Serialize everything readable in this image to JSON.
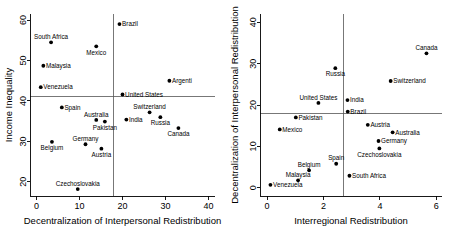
{
  "figure": {
    "panel_count": 2,
    "background": "#ffffff",
    "point_color": "#000000",
    "refline_color": "#555555"
  },
  "chart_data": [
    {
      "type": "scatter",
      "panel": "left",
      "title": "",
      "xlabel": "Decentralization of Interpersonal Redistribution",
      "ylabel": "Income Inequality",
      "xlim": [
        -1.5,
        41.5
      ],
      "ylim": [
        16.5,
        61.5
      ],
      "xticks": [
        0,
        10,
        20,
        30,
        40
      ],
      "yticks": [
        20,
        30,
        40,
        50,
        60
      ],
      "xtick_labels": [
        "0",
        "10",
        "20",
        "30",
        "40"
      ],
      "ytick_labels": [
        "20",
        "30",
        "40",
        "50",
        "60"
      ],
      "grid": false,
      "legend": "none",
      "reference_lines": {
        "horizontal_y": 41.0,
        "vertical_x": 18.0
      },
      "points": [
        {
          "label": "Brazil",
          "x": 19.3,
          "y": 59.0,
          "label_pos": "right"
        },
        {
          "label": "South Africa",
          "x": 3.4,
          "y": 54.5,
          "label_pos": "above"
        },
        {
          "label": "Mexico",
          "x": 13.9,
          "y": 53.5,
          "label_pos": "below"
        },
        {
          "label": "Malaysia",
          "x": 1.6,
          "y": 48.7,
          "label_pos": "right"
        },
        {
          "label": "Argenti",
          "x": 30.9,
          "y": 45.0,
          "label_pos": "right"
        },
        {
          "label": "Venezuela",
          "x": 1.0,
          "y": 43.4,
          "label_pos": "right"
        },
        {
          "label": "United States",
          "x": 20.0,
          "y": 41.6,
          "label_pos": "right"
        },
        {
          "label": "Spain",
          "x": 5.9,
          "y": 38.4,
          "label_pos": "right"
        },
        {
          "label": "Switzerland",
          "x": 26.3,
          "y": 37.2,
          "label_pos": "above"
        },
        {
          "label": "Russia",
          "x": 28.8,
          "y": 36.0,
          "label_pos": "below"
        },
        {
          "label": "India",
          "x": 20.9,
          "y": 35.4,
          "label_pos": "right"
        },
        {
          "label": "Australia",
          "x": 13.9,
          "y": 35.3,
          "label_pos": "above"
        },
        {
          "label": "Pakistan",
          "x": 15.9,
          "y": 34.9,
          "label_pos": "below"
        },
        {
          "label": "Canada",
          "x": 33.0,
          "y": 33.3,
          "label_pos": "below"
        },
        {
          "label": "Germany",
          "x": 11.4,
          "y": 29.3,
          "label_pos": "above"
        },
        {
          "label": "Belgium",
          "x": 3.6,
          "y": 29.9,
          "label_pos": "below"
        },
        {
          "label": "Austria",
          "x": 15.1,
          "y": 28.2,
          "label_pos": "below"
        },
        {
          "label": "Czechoslovakia",
          "x": 9.6,
          "y": 18.2,
          "label_pos": "above"
        }
      ]
    },
    {
      "type": "scatter",
      "panel": "right",
      "title": "",
      "xlabel": "Interregional Redistribution",
      "ylabel": "Decentralization of Interpersonal Redistribution",
      "xlim": [
        -0.25,
        6.2
      ],
      "ylim": [
        -2.0,
        42.0
      ],
      "xticks": [
        0,
        2,
        4,
        6
      ],
      "yticks": [
        0,
        10,
        20,
        30,
        40
      ],
      "xtick_labels": [
        "0",
        "2",
        "4",
        "6"
      ],
      "ytick_labels": [
        "0",
        "10",
        "20",
        "30",
        "40"
      ],
      "grid": false,
      "legend": "none",
      "reference_lines": {
        "horizontal_y": 18.0,
        "vertical_x": 2.7
      },
      "points": [
        {
          "label": "Canada",
          "x": 5.65,
          "y": 32.5,
          "label_pos": "above"
        },
        {
          "label": "Russia",
          "x": 2.42,
          "y": 28.9,
          "label_pos": "below"
        },
        {
          "label": "Switzerland",
          "x": 4.38,
          "y": 25.8,
          "label_pos": "right"
        },
        {
          "label": "India",
          "x": 2.85,
          "y": 21.2,
          "label_pos": "right"
        },
        {
          "label": "United States",
          "x": 1.82,
          "y": 20.5,
          "label_pos": "above"
        },
        {
          "label": "Brazil",
          "x": 2.86,
          "y": 18.4,
          "label_pos": "right"
        },
        {
          "label": "Pakistan",
          "x": 1.02,
          "y": 17.0,
          "label_pos": "right"
        },
        {
          "label": "Austria",
          "x": 3.57,
          "y": 15.2,
          "label_pos": "right"
        },
        {
          "label": "Australia",
          "x": 4.45,
          "y": 13.4,
          "label_pos": "right"
        },
        {
          "label": "Mexico",
          "x": 0.45,
          "y": 14.1,
          "label_pos": "right"
        },
        {
          "label": "Germany",
          "x": 3.95,
          "y": 11.3,
          "label_pos": "right"
        },
        {
          "label": "Czechoslovakia",
          "x": 3.98,
          "y": 9.5,
          "label_pos": "below"
        },
        {
          "label": "Spain",
          "x": 2.45,
          "y": 5.8,
          "label_pos": "above"
        },
        {
          "label": "Belgium",
          "x": 1.49,
          "y": 4.2,
          "label_pos": "above"
        },
        {
          "label": "South Africa",
          "x": 2.92,
          "y": 2.9,
          "label_pos": "right"
        },
        {
          "label": "Malaysia",
          "x": 1.1,
          "y": 1.8,
          "label_pos": "above"
        },
        {
          "label": "Venezuela",
          "x": 0.12,
          "y": 0.7,
          "label_pos": "right"
        }
      ]
    }
  ]
}
